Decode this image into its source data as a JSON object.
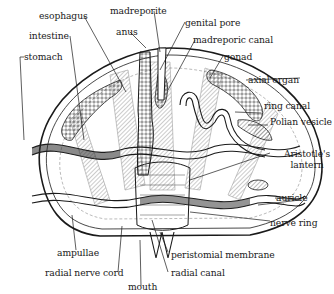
{
  "diagram": {
    "colors": {
      "ink": "#1a1a1a",
      "background": "#ffffff",
      "hatch": "#555555"
    },
    "labels": {
      "esophagus": "esophagus",
      "madreporite": "madreporite",
      "anus": "anus",
      "genital_pore": "genital pore",
      "madreporic_canal": "madreporic canal",
      "intestine": "intestine",
      "stomach": "stomach",
      "gonad": "gonad",
      "axial_organ": "axial organ",
      "ring_canal": "ring canal",
      "polian_vesicle": "Polian vesicle",
      "aristotles_lantern_1": "Aristotle's",
      "aristotles_lantern_2": "lantern",
      "auricle": "auricle",
      "nerve_ring": "nerve ring",
      "ampullae": "ampullae",
      "peristomial_membrane": "peristomial membrane",
      "radial_nerve_cord": "radial nerve cord",
      "radial_canal": "radial canal",
      "mouth": "mouth"
    }
  }
}
